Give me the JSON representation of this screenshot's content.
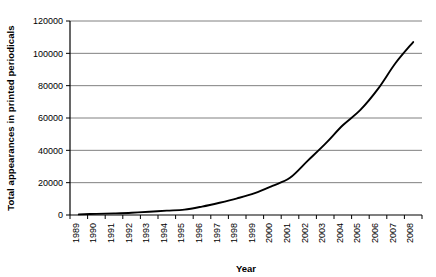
{
  "chart_data": {
    "type": "line",
    "title": "",
    "xlabel": "Year",
    "ylabel": "Total appearances in printed periodicals",
    "x": [
      1989,
      1990,
      1991,
      1992,
      1993,
      1994,
      1995,
      1996,
      1997,
      1998,
      1999,
      2000,
      2001,
      2002,
      2003,
      2004,
      2005,
      2006,
      2007,
      2008
    ],
    "values": [
      400,
      700,
      1000,
      1400,
      2000,
      2700,
      3300,
      5200,
      7600,
      10300,
      13500,
      18000,
      23000,
      33500,
      44000,
      55500,
      65000,
      78000,
      94000,
      107000
    ],
    "series": [
      {
        "name": "Total appearances in printed periodicals",
        "values": [
          400,
          700,
          1000,
          1400,
          2000,
          2700,
          3300,
          5200,
          7600,
          10300,
          13500,
          18000,
          23000,
          33500,
          44000,
          55500,
          65000,
          78000,
          94000,
          107000
        ]
      }
    ],
    "xtick_labels": [
      "1989",
      "1990",
      "1991",
      "1992",
      "1993",
      "1994",
      "1995",
      "1996",
      "1997",
      "1998",
      "1999",
      "2000",
      "2001",
      "2002",
      "2003",
      "2004",
      "2005",
      "2006",
      "2007",
      "2008"
    ],
    "ytick_labels": [
      "0",
      "20000",
      "40000",
      "60000",
      "80000",
      "100000",
      "120000"
    ],
    "ytick_values": [
      0,
      20000,
      40000,
      60000,
      80000,
      100000,
      120000
    ],
    "ylim": [
      0,
      120000
    ],
    "xlim": [
      1989,
      2008
    ],
    "grid": "horizontal",
    "legend": "none",
    "line_color": "#000000",
    "grid_color": "#808080",
    "axis_color": "#000000",
    "background_color": "#ffffff"
  }
}
